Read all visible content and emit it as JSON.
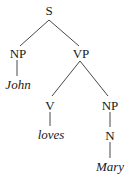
{
  "diagram": {
    "type": "syntax-tree",
    "nodes": {
      "s": {
        "label": "S"
      },
      "np_subject": {
        "label": "NP"
      },
      "john": {
        "label": "John"
      },
      "vp": {
        "label": "VP"
      },
      "v": {
        "label": "V"
      },
      "loves": {
        "label": "loves"
      },
      "np_object": {
        "label": "NP"
      },
      "n": {
        "label": "N"
      },
      "mary": {
        "label": "Mary"
      }
    },
    "edges": [
      [
        "S",
        "NP"
      ],
      [
        "S",
        "VP"
      ],
      [
        "NP",
        "John"
      ],
      [
        "VP",
        "V"
      ],
      [
        "VP",
        "NP"
      ],
      [
        "V",
        "loves"
      ],
      [
        "NP",
        "N"
      ],
      [
        "N",
        "Mary"
      ]
    ],
    "line_color": "#333333",
    "text_color": "#1a1a1a"
  }
}
